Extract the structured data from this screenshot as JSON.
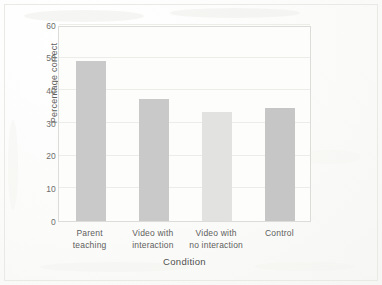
{
  "chart_data": {
    "type": "bar",
    "title": "",
    "xlabel": "Condition",
    "ylabel": "Percentage correct",
    "categories": [
      "Parent teaching",
      "Video with interaction",
      "Video with no interaction",
      "Control"
    ],
    "category_lines": [
      [
        "Parent",
        "teaching"
      ],
      [
        "Video with",
        "interaction"
      ],
      [
        "Video with",
        "no interaction"
      ],
      [
        "Control"
      ]
    ],
    "values": [
      49,
      37.5,
      33.5,
      34.5
    ],
    "ylim": [
      0,
      60
    ],
    "yticks": [
      0,
      10,
      20,
      30,
      40,
      50,
      60
    ],
    "ytick_labels": [
      "0",
      "10",
      "20",
      "30",
      "40",
      "50",
      "60"
    ],
    "grid": "horizontal",
    "legend": "none",
    "bar_colors": [
      "#c9c9c9",
      "#c9c9c9",
      "#e2e2e1",
      "#c6c6c6"
    ]
  }
}
